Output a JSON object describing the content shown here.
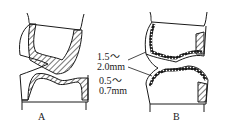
{
  "figure": {
    "panels": [
      {
        "label": "A",
        "description": "occlusal reduction, hatched layer"
      },
      {
        "label": "B",
        "description": "occlusal reduction, dotted layer"
      }
    ],
    "dimensions": [
      {
        "line1": "1.5～",
        "line2": "2.0mm"
      },
      {
        "line1": "0.5～",
        "line2": "0.7mm"
      }
    ],
    "colors": {
      "ink": "#1a1a1a",
      "background": "#ffffff"
    }
  }
}
